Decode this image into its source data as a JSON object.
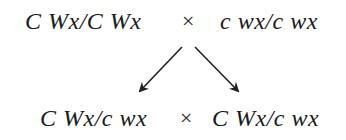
{
  "diagram": {
    "type": "genetic-cross",
    "parents": {
      "left": "C Wx/C Wx",
      "operator": "×",
      "right": "c wx/c wx"
    },
    "offspring": {
      "left": "C Wx/c wx",
      "operator": "×",
      "right": "C Wx/c wx"
    },
    "arrows": [
      {
        "from": [
          182,
          47
        ],
        "to": [
          138,
          93
        ]
      },
      {
        "from": [
          195,
          47
        ],
        "to": [
          240,
          93
        ]
      }
    ],
    "colors": {
      "text": "#1a1a1a",
      "arrow": "#222222",
      "background": "#ffffff"
    }
  }
}
